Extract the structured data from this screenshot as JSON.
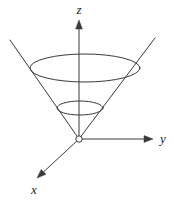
{
  "figure": {
    "kind": "3d-cone-diagram",
    "width": 174,
    "height": 204,
    "background_color": "#ffffff",
    "stroke_color": "#3a3a3a",
    "axis_color": "#3a3a3a",
    "label_color": "#1a1a1a",
    "line_width": 1
  },
  "axes": {
    "origin": {
      "label": "O",
      "x": 79,
      "y": 139,
      "marker": "open-circle",
      "radius": 3.2
    },
    "items": [
      {
        "name": "z",
        "label": "z",
        "direction": "up",
        "from": {
          "x": 79,
          "y": 139
        },
        "to": {
          "x": 79,
          "y": 20
        },
        "arrowhead": "filled-triangle",
        "label_pos": {
          "x": 79,
          "y": 11
        }
      },
      {
        "name": "y",
        "label": "y",
        "direction": "right",
        "from": {
          "x": 79,
          "y": 139
        },
        "to": {
          "x": 153,
          "y": 139
        },
        "arrowhead": "filled-triangle",
        "label_pos": {
          "x": 163,
          "y": 140
        }
      },
      {
        "name": "x",
        "label": "x",
        "direction": "down-left",
        "from": {
          "x": 79,
          "y": 139
        },
        "to": {
          "x": 37,
          "y": 178
        },
        "arrowhead": "filled-triangle",
        "label_pos": {
          "x": 34,
          "y": 191
        }
      }
    ]
  },
  "cone": {
    "apex": {
      "x": 79,
      "y": 139
    },
    "opens": "upward",
    "cross_sections": [
      {
        "name": "upper-ellipse",
        "cx": 85,
        "cy": 68,
        "rx": 55,
        "ry": 14
      },
      {
        "name": "lower-ellipse",
        "cx": 80,
        "cy": 108,
        "rx": 23,
        "ry": 7
      }
    ],
    "slant_lines": [
      {
        "name": "left-slant",
        "from": {
          "x": 79,
          "y": 139
        },
        "to": {
          "x": 10,
          "y": 40
        }
      },
      {
        "name": "right-slant",
        "from": {
          "x": 79,
          "y": 139
        },
        "to": {
          "x": 155,
          "y": 38
        }
      }
    ]
  }
}
